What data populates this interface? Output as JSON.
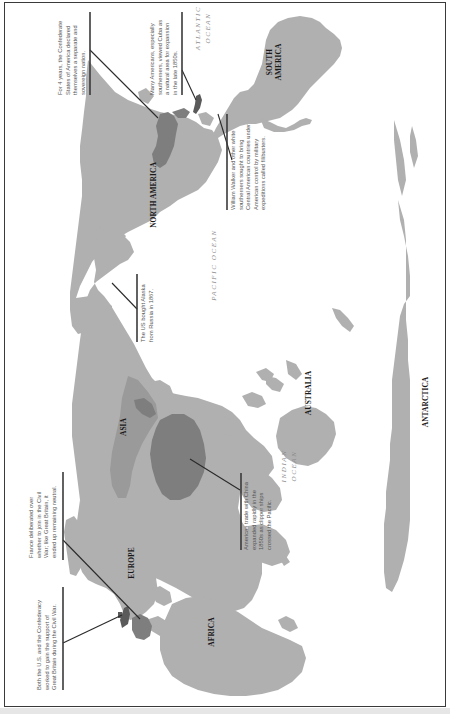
{
  "map": {
    "orientation": "rotated 90 degrees clockwise",
    "colors": {
      "land": "#b0b0b0",
      "land_highlight_mid": "#9a9a9a",
      "land_highlight_dark": "#7e7e7e",
      "land_highlight_darker": "#5a5a5a",
      "ocean": "#ffffff",
      "border": "#3a3a3a"
    },
    "regions": {
      "north_america": "NORTH AMERICA",
      "south_america_line1": "SOUTH",
      "south_america_line2": "AMERICA",
      "asia": "ASIA",
      "europe": "EUROPE",
      "africa": "AFRICA",
      "australia": "AUSTRALIA",
      "antarctica": "ANTARCTICA"
    },
    "oceans": {
      "atlantic_line1": "ATLANTIC",
      "atlantic_line2": "OCEAN",
      "pacific": "PACIFIC OCEAN",
      "indian_line1": "INDIAN",
      "indian_line2": "OCEAN"
    },
    "annotations": {
      "confederacy": {
        "lines": [
          "For 4 years, the Confederate",
          "States of America declared",
          "themselves a separate and",
          "sovereign nation."
        ]
      },
      "cuba": {
        "lines": [
          "Many Americans, especially",
          "southerners, viewed Cuba as",
          "a natural area for expansion",
          "in the late 1850s."
        ]
      },
      "filibusters": {
        "lines": [
          "William Walker and other white",
          "southerners sought to bring",
          "Central American countries under",
          "American control by military",
          "expeditions called filibusters."
        ]
      },
      "alaska": {
        "lines": [
          "The US bought Alaska",
          "from Russia in 1867."
        ]
      },
      "china": {
        "lines": [
          "American trade with China",
          "expanded rapidly in the",
          "1850s as clipper ships",
          "crossed the Pacific."
        ]
      },
      "france": {
        "lines": [
          "France deliberated over",
          "whether to join in the Civil",
          "War; like Great Britain, it",
          "ended up remaining neutral."
        ]
      },
      "britain": {
        "lines": [
          "Both the U.S. and the Confederacy",
          "worked to gain the support of",
          "Great Britain during the Civil War."
        ]
      }
    }
  }
}
